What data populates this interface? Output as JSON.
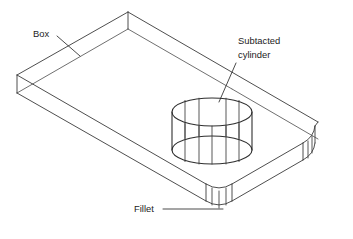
{
  "figure": {
    "type": "isometric-cad-wireframe",
    "background_color": "#ffffff",
    "line_color": "#3a3a3a",
    "text_color": "#1c1c1c",
    "width": 353,
    "height": 239
  },
  "annotations": {
    "box": {
      "label": "Box",
      "text_x": 33,
      "text_y": 37,
      "leader_from_x": 57,
      "leader_from_y": 36,
      "leader_to_x": 80,
      "leader_to_y": 56
    },
    "cylinder": {
      "label_line1": "Subtacted",
      "label_line2": "cylinder",
      "text_x": 238,
      "text_y": 44,
      "text_y2": 58,
      "leader_from_x": 236,
      "leader_from_y": 63,
      "leader_to_x": 219,
      "leader_to_y": 102
    },
    "fillet": {
      "label": "Fillet",
      "text_x": 134,
      "text_y": 212,
      "leader_from_x": 163,
      "leader_from_y": 209,
      "leader_to_x": 223,
      "leader_to_y": 209
    }
  },
  "geometry": {
    "box": {
      "top_face": "isometric rectangular plate top surface",
      "thickness_visible": true,
      "vertices": {
        "top_apex": [
          128,
          12
        ],
        "left": [
          17,
          75
        ],
        "right_far": [
          318,
          122
        ],
        "bottom_front": [
          212,
          190
        ]
      }
    },
    "cylinder": {
      "description": "subtracted (through/blind) cylindrical hole shown as wireframe",
      "center_x": 212,
      "top_ellipse_cy": 112,
      "bottom_ellipse_cy": 150,
      "rx": 40,
      "ry": 14,
      "iso_lines": 5
    },
    "fillets": {
      "description": "rounded vertical corner edges",
      "corners": [
        "front-bottom",
        "right"
      ],
      "line_count_per_corner": 4
    }
  }
}
